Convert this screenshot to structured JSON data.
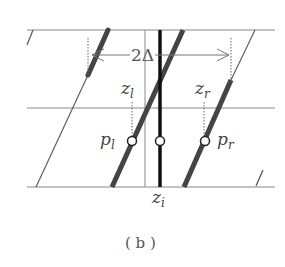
{
  "diagram": {
    "caption": "( b )",
    "dimension_label": "2Δ",
    "labels": {
      "z_l": {
        "base": "z",
        "sub": "l"
      },
      "z_r": {
        "base": "z",
        "sub": "r"
      },
      "p_l": {
        "base": "p",
        "sub": "l"
      },
      "p_r": {
        "base": "p",
        "sub": "r"
      },
      "z_i": {
        "base": "z",
        "sub": "i"
      }
    },
    "colors": {
      "thin_line": "#777777",
      "thick_line": "#444444",
      "center_line": "#111111",
      "dashed": "#666666",
      "circle_fill": "#ffffff"
    }
  }
}
